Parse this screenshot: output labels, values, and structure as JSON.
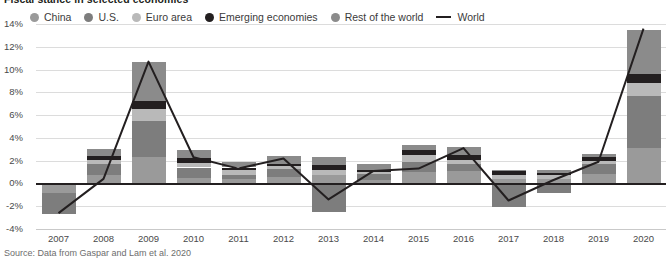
{
  "header": {
    "title": "Fiscal stance in selected economies"
  },
  "legend": {
    "items": [
      {
        "label": "China",
        "color": "#9a9a9a",
        "marker": "dot"
      },
      {
        "label": "U.S.",
        "color": "#7d7d7d",
        "marker": "dot"
      },
      {
        "label": "Euro area",
        "color": "#b9b9b9",
        "marker": "dot"
      },
      {
        "label": "Emerging economies",
        "color": "#231f20",
        "marker": "dot"
      },
      {
        "label": "Rest of the world",
        "color": "#8b8b8b",
        "marker": "dot"
      },
      {
        "label": "World",
        "color": "#231f20",
        "marker": "line"
      }
    ]
  },
  "source": {
    "text": "Source: Data from Gaspar and Lam et al. 2020"
  },
  "chart_data": {
    "type": "bar",
    "stacked": true,
    "title": "Fiscal stance in selected economies",
    "xlabel": "",
    "ylabel": "",
    "ylim": [
      -4,
      14
    ],
    "yticks": [
      "14%",
      "12%",
      "10%",
      "8%",
      "6%",
      "4%",
      "2%",
      "0%",
      "-2%",
      "-4%"
    ],
    "ytick_values": [
      14,
      12,
      10,
      8,
      6,
      4,
      2,
      0,
      -2,
      -4
    ],
    "grid": true,
    "legend_position": "top",
    "categories": [
      "2007",
      "2008",
      "2009",
      "2010",
      "2011",
      "2012",
      "2013",
      "2014",
      "2015",
      "2016",
      "2017",
      "2018",
      "2019",
      "2020"
    ],
    "series": [
      {
        "name": "China",
        "color": "#9a9a9a",
        "values": [
          -0.8,
          0.7,
          2.3,
          0.5,
          0.4,
          0.6,
          0.7,
          0.3,
          1.0,
          1.1,
          0.4,
          0.4,
          0.8,
          3.1
        ]
      },
      {
        "name": "U.S.",
        "color": "#7d7d7d",
        "values": [
          -1.9,
          1.0,
          3.2,
          0.9,
          0.3,
          0.7,
          -2.5,
          0.5,
          0.9,
          0.6,
          -2.1,
          -0.8,
          0.9,
          4.6
        ]
      },
      {
        "name": "Euro area",
        "color": "#b9b9b9",
        "values": [
          0.0,
          0.4,
          1.0,
          0.4,
          0.5,
          0.2,
          0.5,
          0.2,
          0.6,
          0.4,
          0.3,
          0.3,
          0.3,
          1.1
        ]
      },
      {
        "name": "Emerging economies",
        "color": "#231f20",
        "values": [
          0.0,
          0.3,
          0.7,
          0.4,
          0.2,
          0.2,
          0.4,
          0.2,
          0.4,
          0.4,
          0.4,
          0.2,
          0.3,
          0.8
        ]
      },
      {
        "name": "Rest of the world",
        "color": "#8b8b8b",
        "values": [
          0.0,
          0.6,
          3.5,
          0.7,
          0.5,
          0.7,
          0.7,
          0.5,
          0.5,
          0.7,
          0.1,
          0.3,
          0.3,
          3.9
        ]
      }
    ],
    "stack_positive": [
      [],
      [
        0.7,
        1.0,
        0.4,
        0.3,
        0.6
      ],
      [
        2.3,
        3.2,
        1.0,
        0.7,
        3.5
      ],
      [
        0.5,
        0.9,
        0.4,
        0.4,
        0.7
      ],
      [
        0.4,
        0.3,
        0.5,
        0.2,
        0.5
      ],
      [
        0.6,
        0.7,
        0.2,
        0.2,
        0.7
      ],
      [
        0.7,
        0.5,
        0.4,
        0.7
      ],
      [
        0.3,
        0.5,
        0.2,
        0.2,
        0.5
      ],
      [
        1.0,
        0.9,
        0.6,
        0.4,
        0.5
      ],
      [
        1.1,
        0.6,
        0.4,
        0.4,
        0.7
      ],
      [
        0.4,
        0.3,
        0.4,
        0.1
      ],
      [
        0.4,
        0.3,
        0.2,
        0.3
      ],
      [
        0.8,
        0.9,
        0.3,
        0.3,
        0.3
      ],
      [
        3.1,
        4.6,
        1.1,
        0.8,
        3.9
      ]
    ],
    "bar_totals_positive": [
      0.0,
      3.0,
      10.7,
      2.9,
      1.9,
      2.4,
      2.3,
      1.7,
      3.4,
      3.2,
      1.2,
      1.2,
      2.6,
      13.5
    ],
    "bar_totals_negative": [
      -2.7,
      0.0,
      0.0,
      0.0,
      0.0,
      0.0,
      -2.5,
      0.0,
      -2.2,
      0.0,
      -2.1,
      -0.8,
      0.0,
      0.0
    ],
    "world_line": {
      "name": "World",
      "color": "#231f20",
      "values": [
        -2.6,
        0.4,
        10.7,
        2.3,
        1.3,
        2.2,
        -1.4,
        1.1,
        1.3,
        3.1,
        -1.5,
        0.3,
        1.9,
        13.6
      ]
    }
  }
}
